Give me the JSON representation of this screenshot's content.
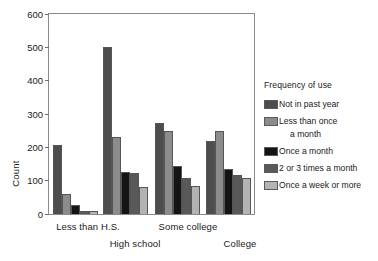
{
  "chart_data": {
    "type": "bar",
    "title": "",
    "xlabel": "",
    "ylabel": "Count",
    "ylim": [
      0,
      600
    ],
    "yticks": [
      0,
      100,
      200,
      300,
      400,
      500,
      600
    ],
    "grid": false,
    "legend_position": "right",
    "legend_title": "Frequency of use",
    "categories": [
      "Less than H.S.",
      "High school",
      "Some college",
      "College"
    ],
    "series": [
      {
        "name": "Not in past year",
        "color": "#4d4d4d",
        "values": [
          207,
          500,
          272,
          218
        ]
      },
      {
        "name": "Less than once a month",
        "color": "#8c8c8c",
        "values": [
          60,
          230,
          249,
          248
        ]
      },
      {
        "name": "Once a month",
        "color": "#141414",
        "values": [
          28,
          125,
          145,
          136
        ]
      },
      {
        "name": "2 or 3 times a month",
        "color": "#595959",
        "values": [
          10,
          122,
          107,
          117
        ]
      },
      {
        "name": "Once a week or more",
        "color": "#b3b3b3",
        "values": [
          10,
          82,
          83,
          108
        ]
      }
    ]
  },
  "legend": {
    "title": "Frequency of use",
    "items": [
      {
        "label": "Not in past year",
        "label_cont": ""
      },
      {
        "label": "Less than once",
        "label_cont": "a month"
      },
      {
        "label": "Once a month",
        "label_cont": ""
      },
      {
        "label": "2 or 3 times a month",
        "label_cont": ""
      },
      {
        "label": "Once a week or more",
        "label_cont": ""
      }
    ]
  },
  "axes": {
    "y_title": "Count",
    "y_ticks": [
      "0",
      "100",
      "200",
      "300",
      "400",
      "500",
      "600"
    ],
    "x_ticks": [
      "Less than H.S.",
      "High school",
      "Some college",
      "College"
    ]
  }
}
